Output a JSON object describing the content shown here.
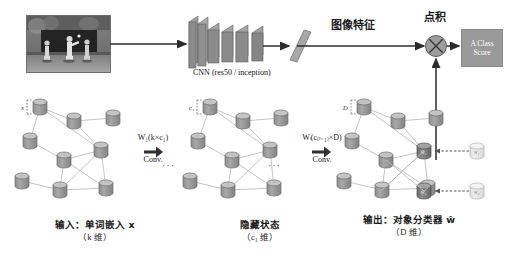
{
  "figure": {
    "type": "architecture-diagram",
    "title_text": "",
    "pipeline": {
      "input_image_label": "",
      "cnn_label": "CNN (res50 / inception)",
      "image_feature_label": "图像特征",
      "dot_product_label": "点积",
      "class_score_label_line1": "A Class",
      "class_score_label_line2": "Score"
    },
    "gcn": {
      "conv1": {
        "weight": "W₁(k×c₁)",
        "arrow": "➡",
        "op": "Conv."
      },
      "conv2": {
        "weight": "Wₗ(c₍ₗ₋₁₎×D)",
        "arrow": "➡",
        "op": "Conv."
      },
      "ellipsis": "···",
      "captions": {
        "input": {
          "line1": "输入：单词嵌入 x",
          "line2": "（k 维）"
        },
        "hidden": {
          "line1": "隐藏状态",
          "line2": "（c₁ 维）"
        },
        "output": {
          "line1": "输出：对象分类器 ŵ",
          "line2": "（D 维）"
        }
      },
      "node_labels": {
        "input_first": "x",
        "hidden_first": "c₁",
        "output_first": "D",
        "classifier_1": "ŵ₁",
        "classifier_2": "ŵ₂",
        "target_1": "w₁",
        "target_2": "w₂"
      }
    },
    "colors": {
      "node_fill": "#9b9b9b",
      "node_top": "#c3c3c3",
      "node_stroke": "#6d6d6d",
      "ghost_fill": "#e6e6e6",
      "ghost_top": "#f2f2f2",
      "edge": "#b5b5b5",
      "arrow": "#2b2b2b",
      "cnn_block": "#8f8f8f",
      "class_box": "#9a9a9a",
      "background": "#ffffff"
    }
  }
}
